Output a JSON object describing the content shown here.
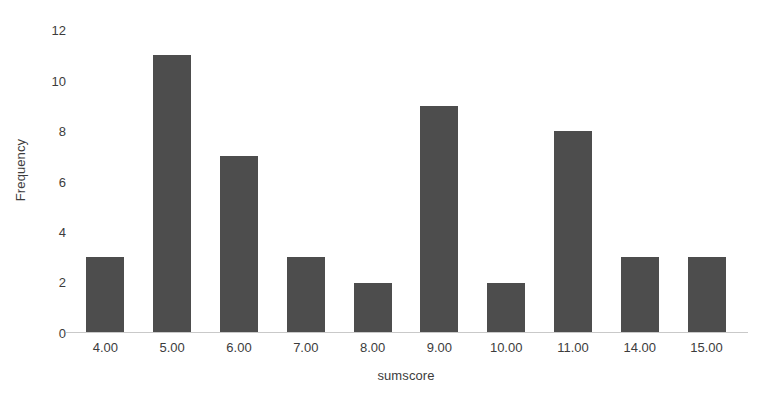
{
  "chart_data": {
    "type": "bar",
    "title": "",
    "subtitle": "",
    "xlabel": "sumscore",
    "ylabel": "Frequency",
    "categories": [
      "4.00",
      "5.00",
      "6.00",
      "7.00",
      "8.00",
      "9.00",
      "10.00",
      "11.00",
      "14.00",
      "15.00"
    ],
    "values": [
      3,
      11,
      7,
      3,
      2,
      9,
      2,
      8,
      3,
      3
    ],
    "ylim": [
      0,
      12
    ],
    "yticks": [
      0,
      2,
      4,
      6,
      8,
      10,
      12
    ],
    "ytick_labels": [
      "0",
      "2",
      "4",
      "6",
      "8",
      "10",
      "12"
    ],
    "grid": false,
    "legend": null,
    "bar_color": "#4d4d4d",
    "axis_color": "#c9c9c9",
    "background_color": "#ffffff",
    "text_color": "#3c3c3c"
  }
}
